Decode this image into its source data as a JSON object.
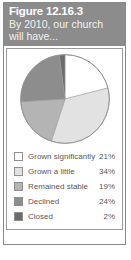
{
  "figure": {
    "title": "Figure 12.16.3",
    "subtitle": "By 2010, our church will have..."
  },
  "chart_data": {
    "type": "pie",
    "title": "By 2010, our church will have...",
    "categories": [
      "Grown significantly",
      "Grown a little",
      "Remained stable",
      "Declined",
      "Closed"
    ],
    "values": [
      21,
      34,
      19,
      24,
      2
    ],
    "value_labels": [
      "21%",
      "34%",
      "19%",
      "24%",
      "2%"
    ],
    "colors": [
      "#ffffff",
      "#e2e2e2",
      "#b4b4b4",
      "#8d8d8d",
      "#6b6b6b"
    ],
    "unit": "%",
    "start_angle_deg": 0,
    "direction": "clockwise",
    "legend_position": "bottom",
    "grid": false
  },
  "legend": {
    "rows": [
      {
        "label": "Grown significantly",
        "value": "21%",
        "color": "#ffffff"
      },
      {
        "label": "Grown a little",
        "value": "34%",
        "color": "#e2e2e2"
      },
      {
        "label": "Remained stable",
        "value": "19%",
        "color": "#b4b4b4"
      },
      {
        "label": "Declined",
        "value": "24%",
        "color": "#8d8d8d"
      },
      {
        "label": "Closed",
        "value": "2%",
        "color": "#6b6b6b"
      }
    ]
  },
  "style": {
    "header_bg": "#8c8c8c",
    "header_text": "#ffffff",
    "panel_border": "#9a9a9a",
    "label_text": "#58585a"
  }
}
